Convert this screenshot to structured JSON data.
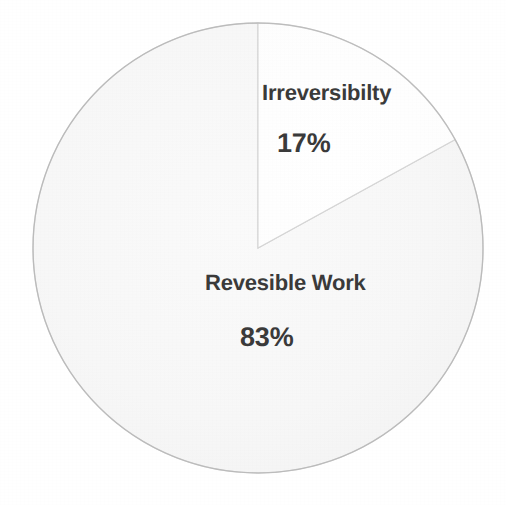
{
  "chart_data": {
    "type": "pie",
    "title": "",
    "labels": [
      "Irreversibilty",
      "Revesible Work"
    ],
    "values": [
      17,
      83
    ],
    "value_labels": [
      "17%",
      "83%"
    ],
    "units": "percent",
    "total": 100,
    "legend": "none",
    "grid": false,
    "start_angle_deg": 0,
    "direction": "clockwise",
    "slices": [
      {
        "name": "Irreversibilty",
        "value": 17,
        "value_label": "17%",
        "color": "#fefefe",
        "start_angle_deg": 0,
        "end_angle_deg": 61.2
      },
      {
        "name": "Revesible Work",
        "value": 83,
        "value_label": "83%",
        "color": "#f6f6f6",
        "start_angle_deg": 61.2,
        "end_angle_deg": 360
      }
    ]
  },
  "figure": {
    "background_color": "#ffffff",
    "outline_color": "#b8b8b8",
    "divider_color": "#d8d8d8",
    "text_color": "#3a3a3a",
    "center_x": 258,
    "center_y": 248,
    "radius": 225
  }
}
